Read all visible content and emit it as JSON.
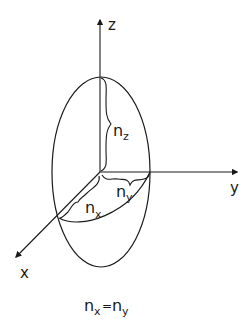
{
  "diagram": {
    "type": "uniaxial index ellipsoid",
    "axes": {
      "z": "z",
      "y": "y",
      "x": "x"
    },
    "semi_axes": {
      "nz": {
        "base": "n",
        "sub": "z"
      },
      "ny": {
        "base": "n",
        "sub": "y"
      },
      "nx": {
        "base": "n",
        "sub": "x"
      }
    },
    "caption": {
      "left_base": "n",
      "left_sub": "x",
      "equals": "=",
      "right_base": "n",
      "right_sub": "y"
    },
    "colors": {
      "stroke": "#1a1a1a",
      "background": "#ffffff"
    }
  }
}
